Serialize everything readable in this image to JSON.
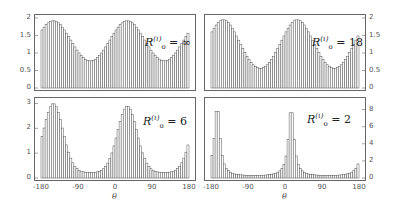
{
  "chart_data": [
    {
      "type": "bar",
      "panel": "top-left",
      "label_symbol": "R",
      "label_sup": "(ι)",
      "label_sub": "o",
      "label_value": "∞",
      "ylim": [
        0,
        2
      ],
      "yticks": [
        "0",
        "0.5",
        "1",
        "1.5",
        "2"
      ],
      "ytick_side": "left",
      "xlim": [
        -180,
        180
      ],
      "xticks": [],
      "bins": 72,
      "shape": {
        "baseline": 0.35,
        "peaks": [
          {
            "x": -150,
            "h": 1.92,
            "w": 45
          },
          {
            "x": 30,
            "h": 1.92,
            "w": 45
          }
        ],
        "period": 180
      }
    },
    {
      "type": "bar",
      "panel": "top-right",
      "label_symbol": "R",
      "label_sup": "(ι)",
      "label_sub": "o",
      "label_value": "18",
      "ylim": [
        0,
        2
      ],
      "yticks": [
        "0",
        "0.5",
        "1",
        "1.5",
        "2"
      ],
      "ytick_side": "right",
      "xlim": [
        -180,
        180
      ],
      "xticks": [],
      "bins": 72,
      "shape": {
        "baseline": 0.3,
        "peaks": [
          {
            "x": -150,
            "h": 1.95,
            "w": 40
          },
          {
            "x": 30,
            "h": 1.95,
            "w": 40
          }
        ],
        "period": 180
      }
    },
    {
      "type": "bar",
      "panel": "bottom-left",
      "label_symbol": "R",
      "label_sup": "(ι)",
      "label_sub": "o",
      "label_value": "6",
      "ylim": [
        0,
        3.1
      ],
      "yticks": [
        "0",
        "1",
        "2",
        "3"
      ],
      "ytick_side": "left",
      "xlim": [
        -180,
        180
      ],
      "xticks": [
        "-180",
        "-90",
        "0",
        "90",
        "180"
      ],
      "xlabel": "θ",
      "bins": 72,
      "shape": {
        "baseline": 0.22,
        "peaks": [
          {
            "x": -150,
            "h": 3.0,
            "w": 24
          },
          {
            "x": 30,
            "h": 2.9,
            "w": 24
          }
        ],
        "period": 180
      }
    },
    {
      "type": "bar",
      "panel": "bottom-right",
      "label_symbol": "R",
      "label_sup": "(ι)",
      "label_sub": "o",
      "label_value": "2",
      "ylim": [
        0,
        9
      ],
      "yticks": [
        "0",
        "2",
        "4",
        "6",
        "8"
      ],
      "ytick_side": "right",
      "xlim": [
        -180,
        180
      ],
      "xticks": [
        "-180",
        "-90",
        "0",
        "90",
        "180"
      ],
      "xlabel": "θ",
      "bins": 72,
      "shape": {
        "baseline": 0.15,
        "peaks": [
          {
            "x": -165,
            "h": 8.5,
            "w": 8
          },
          {
            "x": 15,
            "h": 8.3,
            "w": 8
          }
        ],
        "period": 180
      }
    }
  ],
  "panels": {
    "tl": {
      "label_value": "∞"
    },
    "tr": {
      "label_value": "18"
    },
    "bl": {
      "label_value": "6"
    },
    "br": {
      "label_value": "2"
    }
  }
}
